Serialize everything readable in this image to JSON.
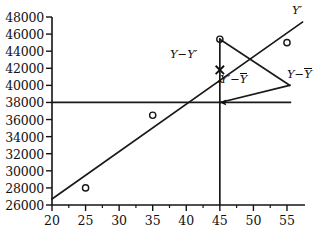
{
  "chart_data": {
    "type": "scatter",
    "title": "",
    "xlabel": "",
    "ylabel": "",
    "xlim": [
      20,
      57.5
    ],
    "ylim": [
      26000,
      48000
    ],
    "grid": false,
    "legend_position": "none",
    "x_ticks": [
      20,
      25,
      30,
      35,
      40,
      45,
      50,
      55
    ],
    "x_tick_labels": [
      "20",
      "25",
      "30",
      "35",
      "40",
      "45",
      "50",
      "55"
    ],
    "x_minor_ticks": [
      22.5,
      27.5,
      32.5,
      37.5,
      42.5,
      47.5,
      52.5
    ],
    "y_ticks": [
      26000,
      28000,
      30000,
      32000,
      34000,
      36000,
      38000,
      40000,
      42000,
      44000,
      46000,
      48000
    ],
    "y_tick_labels": [
      "26000",
      "28000",
      "30000",
      "32000",
      "34000",
      "36000",
      "38000",
      "40000",
      "42000",
      "44000",
      "46000",
      "48000"
    ],
    "series": [
      {
        "name": "observations",
        "type": "scatter",
        "marker": "open-circle",
        "points": [
          {
            "x": 25,
            "y": 28000
          },
          {
            "x": 35,
            "y": 36500
          },
          {
            "x": 45,
            "y": 45400
          },
          {
            "x": 55,
            "y": 45000
          }
        ]
      },
      {
        "name": "regression-line",
        "type": "line",
        "label": "Y'",
        "points": [
          {
            "x": 20,
            "y": 26700
          },
          {
            "x": 57.3,
            "y": 47400
          }
        ]
      },
      {
        "name": "mean-line",
        "type": "line",
        "label": "Y-bar",
        "value": 38000,
        "points": [
          {
            "x": 20,
            "y": 38000
          },
          {
            "x": 55.5,
            "y": 38000
          }
        ]
      },
      {
        "name": "vertical-reference-line",
        "type": "line",
        "value": 45,
        "points": [
          {
            "x": 45,
            "y": 26000
          },
          {
            "x": 45,
            "y": 45400
          }
        ]
      },
      {
        "name": "total-deviation-connector",
        "type": "line",
        "points": [
          {
            "x": 45,
            "y": 45400
          },
          {
            "x": 55.4,
            "y": 40000
          }
        ]
      },
      {
        "name": "explained-deviation-connector",
        "type": "line",
        "points": [
          {
            "x": 45,
            "y": 38000
          },
          {
            "x": 55.4,
            "y": 40000
          }
        ]
      }
    ],
    "annotations": [
      {
        "name": "y-prime-line-label",
        "text": "Y′",
        "x": 56.2,
        "y": 47800
      },
      {
        "name": "residual-label",
        "text": "Y−Y′",
        "x": 39.6,
        "y": 42400
      },
      {
        "name": "explained-label",
        "text": "Y′−Ȳ",
        "x": 46.0,
        "y": 40100
      },
      {
        "name": "total-label",
        "text": "Y−Ȳ",
        "x": 53.5,
        "y": 40400
      }
    ],
    "markers": [
      {
        "name": "fitted-value-cross",
        "glyph": "x-cross",
        "x": 45,
        "y": 41800
      }
    ]
  },
  "annotations": {
    "y_prime": "Y′",
    "residual_pre": "Y−Y",
    "residual_prime": "′",
    "explained_pre": "Y",
    "explained_prime": "′",
    "explained_minus": "−",
    "explained_bar": "Y",
    "total_pre": "Y",
    "total_minus": "−",
    "total_bar": "Y"
  },
  "colors": {
    "ink": "#111111",
    "line": "#1a1a1a",
    "background": "#ffffff"
  }
}
